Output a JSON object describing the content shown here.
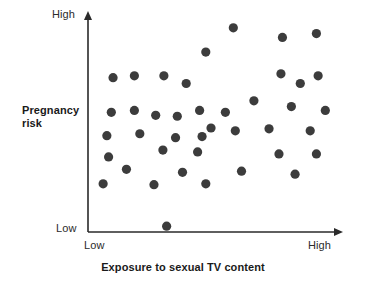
{
  "chart_data": {
    "type": "scatter",
    "title": "",
    "xlabel": "Exposure to sexual TV content",
    "ylabel": "Pregnancy risk",
    "x_tick_labels": [
      "Low",
      "High"
    ],
    "y_tick_labels": [
      "Low",
      "High"
    ],
    "xlim": [
      0,
      100
    ],
    "ylim": [
      0,
      100
    ],
    "grid": false,
    "legend": "none",
    "marker_color": "#3c3c3c",
    "axis_color": "#2a2a2a",
    "marker_radius_px": 4.6,
    "series": [
      {
        "name": "observations",
        "points": [
          {
            "x": 10.1,
            "y": 72.1
          },
          {
            "x": 18.7,
            "y": 73.0
          },
          {
            "x": 30.6,
            "y": 73.0
          },
          {
            "x": 58.6,
            "y": 95.4
          },
          {
            "x": 78.4,
            "y": 90.9
          },
          {
            "x": 92.1,
            "y": 92.7
          },
          {
            "x": 47.5,
            "y": 84.1
          },
          {
            "x": 77.8,
            "y": 73.9
          },
          {
            "x": 92.8,
            "y": 73.0
          },
          {
            "x": 39.6,
            "y": 69.4
          },
          {
            "x": 85.6,
            "y": 69.4
          },
          {
            "x": 9.4,
            "y": 55.9
          },
          {
            "x": 18.7,
            "y": 56.8
          },
          {
            "x": 66.9,
            "y": 61.3
          },
          {
            "x": 82.0,
            "y": 58.6
          },
          {
            "x": 95.7,
            "y": 56.8
          },
          {
            "x": 27.3,
            "y": 54.5
          },
          {
            "x": 36.0,
            "y": 54.1
          },
          {
            "x": 45.0,
            "y": 56.8
          },
          {
            "x": 55.4,
            "y": 55.9
          },
          {
            "x": 49.6,
            "y": 48.6
          },
          {
            "x": 7.6,
            "y": 45.0
          },
          {
            "x": 20.9,
            "y": 45.9
          },
          {
            "x": 35.3,
            "y": 44.1
          },
          {
            "x": 46.0,
            "y": 44.6
          },
          {
            "x": 59.4,
            "y": 47.3
          },
          {
            "x": 73.0,
            "y": 48.2
          },
          {
            "x": 89.6,
            "y": 47.3
          },
          {
            "x": 8.3,
            "y": 35.1
          },
          {
            "x": 30.2,
            "y": 38.3
          },
          {
            "x": 44.2,
            "y": 37.4
          },
          {
            "x": 77.0,
            "y": 36.5
          },
          {
            "x": 92.1,
            "y": 36.5
          },
          {
            "x": 15.5,
            "y": 29.3
          },
          {
            "x": 38.1,
            "y": 27.9
          },
          {
            "x": 61.9,
            "y": 28.4
          },
          {
            "x": 83.5,
            "y": 27.0
          },
          {
            "x": 6.1,
            "y": 22.5
          },
          {
            "x": 26.6,
            "y": 22.1
          },
          {
            "x": 47.5,
            "y": 22.5
          },
          {
            "x": 31.7,
            "y": 2.7
          }
        ]
      }
    ]
  },
  "axes": {
    "y_high_label": "High",
    "y_low_label": "Low",
    "x_low_label": "Low",
    "x_high_label": "High",
    "y_axis_title": "Pregnancy risk",
    "x_axis_title": "Exposure to sexual TV content"
  }
}
